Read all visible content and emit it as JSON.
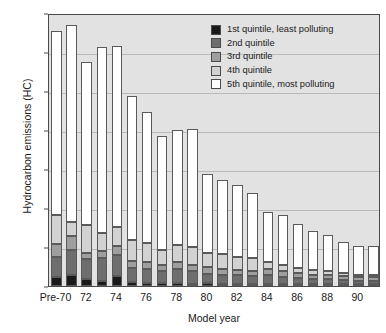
{
  "chart_data": {
    "type": "bar",
    "subtype": "stacked-bar",
    "title": "",
    "xlabel": "Model year",
    "ylabel": "Hydrocarbon emissions (HC)",
    "ylim": [
      0.0,
      0.7
    ],
    "ytick_values": [
      0.0,
      0.1,
      0.2,
      0.3,
      0.4,
      0.5,
      0.6,
      0.7
    ],
    "ytick_labels": [
      "0.0",
      "0.1",
      "0.2",
      "0.3",
      "0.4",
      "0.5",
      "0.6",
      "0.7"
    ],
    "grid": true,
    "grid_axis": "y",
    "legend_position": "upper right",
    "categories": [
      "Pre-70",
      "71",
      "72",
      "73",
      "74",
      "75",
      "76",
      "77",
      "78",
      "79",
      "80",
      "81",
      "82",
      "83",
      "84",
      "85",
      "86",
      "87",
      "88",
      "89",
      "90",
      "91"
    ],
    "xtick_labels_shown": [
      "Pre-70",
      "72",
      "74",
      "76",
      "78",
      "80",
      "82",
      "84",
      "86",
      "88",
      "90"
    ],
    "series": [
      {
        "name": "1st quintile, least polluting",
        "color": "#1a1a1a",
        "values": [
          0.023,
          0.029,
          0.017,
          0.014,
          0.026,
          0.009,
          0.008,
          0.007,
          0.007,
          0.006,
          0.007,
          0.006,
          0.006,
          0.006,
          0.006,
          0.005,
          0.005,
          0.005,
          0.005,
          0.004,
          0.004,
          0.004
        ]
      },
      {
        "name": "2nd quintile",
        "color": "#6e6e6e",
        "values": [
          0.051,
          0.063,
          0.051,
          0.058,
          0.054,
          0.036,
          0.035,
          0.031,
          0.037,
          0.033,
          0.025,
          0.022,
          0.021,
          0.019,
          0.022,
          0.019,
          0.016,
          0.013,
          0.013,
          0.011,
          0.01,
          0.01
        ]
      },
      {
        "name": "3rd quintile",
        "color": "#9e9e9e",
        "values": [
          0.033,
          0.035,
          0.017,
          0.017,
          0.022,
          0.018,
          0.019,
          0.017,
          0.018,
          0.016,
          0.017,
          0.015,
          0.014,
          0.013,
          0.015,
          0.014,
          0.012,
          0.011,
          0.011,
          0.01,
          0.009,
          0.009
        ]
      },
      {
        "name": "4th quintile",
        "color": "#d2d2d2",
        "values": [
          0.075,
          0.036,
          0.072,
          0.048,
          0.05,
          0.054,
          0.047,
          0.038,
          0.044,
          0.045,
          0.036,
          0.04,
          0.034,
          0.034,
          0.018,
          0.015,
          0.012,
          0.012,
          0.01,
          0.008,
          0.005,
          0.004
        ]
      },
      {
        "name": "5th quintile, most polluting",
        "color": "#ffffff",
        "values": [
          0.473,
          0.505,
          0.417,
          0.477,
          0.463,
          0.371,
          0.336,
          0.291,
          0.294,
          0.302,
          0.203,
          0.188,
          0.184,
          0.166,
          0.129,
          0.128,
          0.115,
          0.101,
          0.093,
          0.081,
          0.075,
          0.076
        ]
      }
    ],
    "totals": [
      0.655,
      0.668,
      0.574,
      0.614,
      0.615,
      0.488,
      0.445,
      0.384,
      0.4,
      0.402,
      0.288,
      0.271,
      0.259,
      0.238,
      0.19,
      0.181,
      0.16,
      0.142,
      0.132,
      0.114,
      0.103,
      0.103
    ]
  },
  "legend": {
    "items": [
      {
        "label": "1st quintile, least polluting",
        "color": "#1a1a1a"
      },
      {
        "label": "2nd quintile",
        "color": "#6e6e6e"
      },
      {
        "label": "3rd quintile",
        "color": "#9e9e9e"
      },
      {
        "label": "4th quintile",
        "color": "#d2d2d2"
      },
      {
        "label": "5th quintile, most polluting",
        "color": "#ffffff"
      }
    ]
  }
}
